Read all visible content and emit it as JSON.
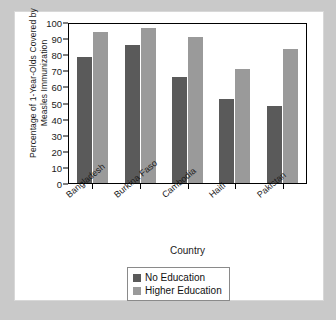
{
  "chart_data": {
    "type": "bar",
    "title": "",
    "xlabel": "Country",
    "ylabel": "Percentage of 1-Year-Olds Covered by Measles Immunization",
    "categories": [
      "Bangladesh",
      "Burkina Faso",
      "Cambodia",
      "Haiti",
      "Pakistan"
    ],
    "series": [
      {
        "name": "No Education",
        "color": "#5a5a5a",
        "values": [
          78,
          86,
          66,
          52,
          48
        ]
      },
      {
        "name": "Higher Education",
        "color": "#9a9a9a",
        "values": [
          94,
          96,
          91,
          71,
          83
        ]
      }
    ],
    "ylim": [
      0,
      100
    ],
    "ytick_values": [
      0,
      10,
      20,
      30,
      40,
      50,
      60,
      70,
      80,
      90,
      100
    ],
    "ytick_labels": [
      "0",
      "10",
      "20",
      "30",
      "40",
      "50",
      "60",
      "70",
      "80",
      "90",
      "100"
    ],
    "grid": false,
    "legend_position": "bottom-center"
  },
  "legend": {
    "entries": [
      {
        "label": "No Education"
      },
      {
        "label": "Higher Education"
      }
    ]
  }
}
